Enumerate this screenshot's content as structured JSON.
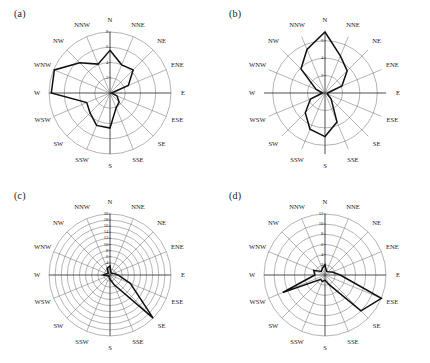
{
  "figure": {
    "background": "#ffffff",
    "line_color": "#111111",
    "grid_color": "#5a5a5a",
    "axis_color": "#3a3a3a",
    "panel_count": 4
  },
  "directions": [
    "N",
    "NNE",
    "NE",
    "ENE",
    "E",
    "ESE",
    "SE",
    "SSE",
    "S",
    "SSW",
    "SW",
    "WSW",
    "W",
    "WNW",
    "NW",
    "NNW"
  ],
  "panels": [
    {
      "label": "(a)",
      "name": "panel-a",
      "chart_data": {
        "type": "line",
        "title": "(a)",
        "xlabel": "",
        "ylabel": "",
        "grid": true,
        "legend": "none",
        "categories": [
          "N",
          "NNE",
          "NE",
          "ENE",
          "E",
          "ESE",
          "SE",
          "SSE",
          "S",
          "SSW",
          "SW",
          "WSW",
          "W",
          "WNW",
          "NW",
          "NNW"
        ],
        "tick_labels": [
          "2",
          "4",
          "6",
          "8"
        ],
        "tick_values": [
          2,
          4,
          6,
          8
        ],
        "rlim": [
          0,
          8
        ],
        "values": [
          5.6,
          4.0,
          4.3,
          2.6,
          0.2,
          1.0,
          1.7,
          2.1,
          4.6,
          4.6,
          3.7,
          3.3,
          7.7,
          7.9,
          5.6,
          4.1
        ]
      }
    },
    {
      "label": "(b)",
      "name": "panel-b",
      "chart_data": {
        "type": "line",
        "title": "(b)",
        "xlabel": "",
        "ylabel": "",
        "grid": true,
        "legend": "none",
        "categories": [
          "N",
          "NNE",
          "NE",
          "ENE",
          "E",
          "ESE",
          "SE",
          "SSE",
          "S",
          "SSW",
          "SW",
          "WSW",
          "W",
          "WNW",
          "NW",
          "NNW"
        ],
        "tick_labels": [
          "2",
          "4",
          "6"
        ],
        "tick_values": [
          2,
          4,
          6
        ],
        "rlim": [
          0,
          7
        ],
        "values": [
          7.0,
          4.6,
          3.6,
          2.1,
          0.3,
          0.3,
          1.0,
          3.6,
          5.0,
          4.5,
          3.2,
          1.8,
          0.3,
          1.1,
          3.9,
          5.4
        ]
      }
    },
    {
      "label": "(c)",
      "name": "panel-c",
      "chart_data": {
        "type": "line",
        "title": "(c)",
        "xlabel": "",
        "ylabel": "",
        "grid": true,
        "legend": "none",
        "categories": [
          "N",
          "NNE",
          "NE",
          "ENE",
          "E",
          "ESE",
          "SE",
          "SSE",
          "S",
          "SSW",
          "SW",
          "WSW",
          "W",
          "WNW",
          "NW",
          "NNW"
        ],
        "tick_labels": [
          "2",
          "4",
          "6",
          "8",
          "10",
          "12",
          "14",
          "16",
          "18",
          "20"
        ],
        "tick_values": [
          2,
          4,
          6,
          8,
          10,
          12,
          14,
          16,
          18,
          20
        ],
        "rlim": [
          0,
          20
        ],
        "values": [
          3.0,
          0.8,
          0.8,
          1.4,
          2.6,
          7.2,
          20.0,
          3.4,
          1.4,
          0.7,
          0.6,
          0.7,
          2.2,
          1.2,
          0.8,
          2.4
        ]
      }
    },
    {
      "label": "(d)",
      "name": "panel-d",
      "chart_data": {
        "type": "line",
        "title": "(d)",
        "xlabel": "",
        "ylabel": "",
        "grid": true,
        "legend": "none",
        "categories": [
          "N",
          "NNE",
          "NE",
          "ENE",
          "E",
          "ESE",
          "SE",
          "SSE",
          "S",
          "SSW",
          "SW",
          "WSW",
          "W",
          "WNW",
          "NW",
          "NNW"
        ],
        "tick_labels": [
          "2",
          "4",
          "6",
          "8",
          "10",
          "12"
        ],
        "tick_values": [
          2,
          4,
          6,
          8,
          10,
          12
        ],
        "rlim": [
          0,
          12
        ],
        "values": [
          2.0,
          0.8,
          0.9,
          1.5,
          3.0,
          12.0,
          10.0,
          2.0,
          1.0,
          1.4,
          1.2,
          9.0,
          2.0,
          2.4,
          1.0,
          1.4
        ]
      }
    }
  ]
}
